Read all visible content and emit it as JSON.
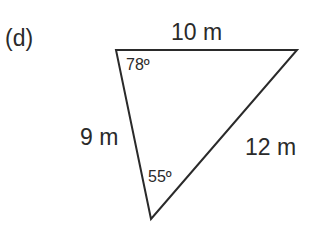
{
  "figure": {
    "part_label": "(d)",
    "triangle": {
      "vertices": {
        "top_left": [
          116,
          50
        ],
        "top_right": [
          297,
          50
        ],
        "bottom": [
          151,
          219
        ]
      },
      "stroke_color": "#2a2a2a",
      "sides": {
        "top": "10 m",
        "left": "9 m",
        "right": "12 m"
      },
      "angles": {
        "top_left": "78º",
        "bottom": "55º"
      }
    }
  }
}
